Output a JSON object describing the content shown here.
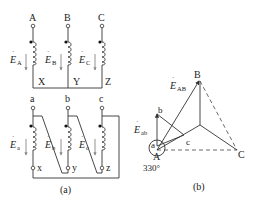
{
  "figure_a": {
    "caption": "(a)",
    "primary": {
      "top_labels": [
        "A",
        "B",
        "C"
      ],
      "bottom_labels": [
        "X",
        "Y",
        "Z"
      ],
      "emf_labels": [
        {
          "sym": "E",
          "sub": "A"
        },
        {
          "sym": "E",
          "sub": "B"
        },
        {
          "sym": "E",
          "sub": "C"
        }
      ]
    },
    "secondary": {
      "top_labels": [
        "a",
        "b",
        "c"
      ],
      "bottom_labels": [
        "x",
        "y",
        "z"
      ],
      "emf_labels": [
        {
          "sym": "E",
          "sub": "a"
        },
        {
          "sym": "E",
          "sub": "b"
        },
        {
          "sym": "E",
          "sub": "c"
        }
      ]
    }
  },
  "figure_b": {
    "caption": "(b)",
    "vertices": {
      "A": "A",
      "B": "B",
      "C": "C",
      "a": "a",
      "b": "b",
      "c": "c"
    },
    "emf_AB": {
      "sym": "E",
      "sub": "AB"
    },
    "emf_ab": {
      "sym": "E",
      "sub": "ab"
    },
    "angle": "330°"
  }
}
